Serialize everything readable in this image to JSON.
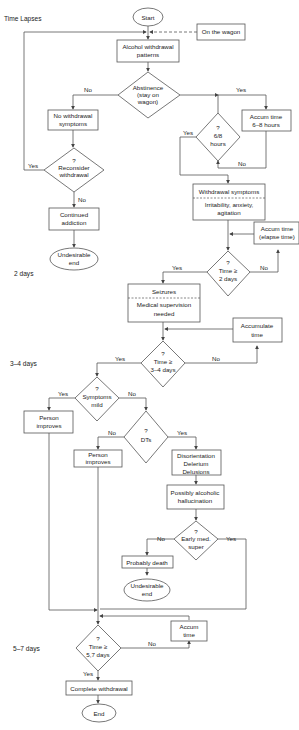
{
  "time_labels": {
    "title": "Time Lapses",
    "t2": "2 days",
    "t3": "3–4 days",
    "t5": "5–7 days"
  },
  "nodes": {
    "start": "Start",
    "on_wagon": "On the wagon",
    "alcohol": [
      "Alcohol withdrawal",
      "patterns"
    ],
    "abstinence": [
      "Abstinence",
      "(stay on",
      "wagon)"
    ],
    "no_withdrawal": [
      "No withdrawal",
      "symptoms"
    ],
    "reconsider": [
      "?",
      "Reconsider",
      "withdrawal"
    ],
    "continued": [
      "Continued",
      "addiction"
    ],
    "undesirable1": [
      "Undesirable",
      "end"
    ],
    "six_eight": [
      "?",
      "6/8",
      "hours"
    ],
    "accum_68": [
      "Accum time",
      "6–8 hours"
    ],
    "withdrawal_symptoms": "Withdrawal symptoms",
    "irritability": [
      "Irritability, anxiety,",
      "agitation"
    ],
    "accum_elapse": [
      "Accum time",
      "(elapse time)"
    ],
    "time2": [
      "?",
      "Time ≥",
      "2 days"
    ],
    "seizures": "Seizures",
    "medical": [
      "Medical supervision",
      "needed"
    ],
    "accumulate": [
      "Accumulate",
      "time"
    ],
    "time34": [
      "?",
      "Time ≥",
      "3–4 days"
    ],
    "symptoms_mild": [
      "?",
      "Symptoms",
      "mild"
    ],
    "person1": [
      "Person",
      "improves"
    ],
    "dts": [
      "?",
      "DTs"
    ],
    "person2": [
      "Person",
      "improves"
    ],
    "disorientation": [
      "Disorientation",
      "Delerium",
      "Delusions"
    ],
    "hallucination": [
      "Possibly alcoholic",
      "hallucination"
    ],
    "early_med": [
      "?",
      "Early med.",
      "super"
    ],
    "death": "Probably death",
    "undesirable2": [
      "Undesirable",
      "end"
    ],
    "accum_time": [
      "Accum",
      "time"
    ],
    "time57": [
      "?",
      "Time ≥",
      "5,7 days"
    ],
    "complete": "Complete withdrawal",
    "end": "End"
  },
  "edge_labels": {
    "yes": "Yes",
    "no": "No"
  }
}
